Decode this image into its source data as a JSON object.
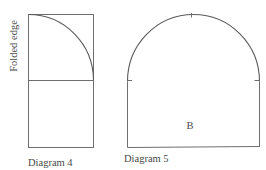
{
  "diagrams": [
    {
      "id": "diagram-4",
      "caption": "Diagram 4",
      "side_label": "Folded edge",
      "shape": "rectangle split horizontally with quarter-circle arc in upper half"
    },
    {
      "id": "diagram-5",
      "caption": "Diagram 5",
      "piece_label": "B",
      "shape": "rectangle with semicircular top (arch) and tick marks"
    }
  ],
  "colors": {
    "line": "#6e6e6e",
    "text": "#4a4a4a",
    "background": "#ffffff"
  }
}
